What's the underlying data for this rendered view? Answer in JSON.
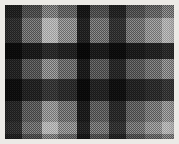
{
  "image": {
    "subject": "plaid-tartan-fabric-swatch",
    "description": "Grayscale checked plaid textile swatch with dithered halftone weave texture",
    "width": 179,
    "height": 144,
    "background_color": "#f2f2f0",
    "border_color": "#eceae6",
    "weave": {
      "x": 5,
      "y": 5,
      "width": 169,
      "height": 134,
      "texture": "halftone-dither-checkerboard",
      "texture_cell_px": 2
    },
    "palette": {
      "darkest": "#1c1c1c",
      "dark": "#343434",
      "mid_dark": "#4f4f4f",
      "mid": "#6e6e6e",
      "mid_light": "#8e8e8e",
      "light": "#b4b4b4",
      "lighter": "#d2d2d2",
      "lightest": "#ececec"
    },
    "warp_bands": [
      {
        "name": "warp-1-dark",
        "x": 0,
        "width": 17,
        "color": "#3a3a3a"
      },
      {
        "name": "warp-2-mid",
        "x": 17,
        "width": 20,
        "color": "#8a8a8a"
      },
      {
        "name": "warp-3-highlight",
        "x": 37,
        "width": 16,
        "color": "#e2e2e2"
      },
      {
        "name": "warp-4-light",
        "x": 53,
        "width": 19,
        "color": "#b0b0b0"
      },
      {
        "name": "warp-5-darkest",
        "x": 72,
        "width": 13,
        "color": "#2a2a2a"
      },
      {
        "name": "warp-6-mid",
        "x": 85,
        "width": 19,
        "color": "#8e8e8e"
      },
      {
        "name": "warp-7-dark",
        "x": 104,
        "width": 17,
        "color": "#3e3e3e"
      },
      {
        "name": "warp-8-mid-light",
        "x": 121,
        "width": 19,
        "color": "#909090"
      },
      {
        "name": "warp-9-light",
        "x": 140,
        "width": 17,
        "color": "#b6b6b6"
      },
      {
        "name": "warp-10-highlight",
        "x": 157,
        "width": 12,
        "color": "#e0e0e0"
      }
    ],
    "weft_bands": [
      {
        "name": "weft-1-mid",
        "y": 0,
        "height": 13,
        "color": "#8c8c8c"
      },
      {
        "name": "weft-2-light",
        "y": 13,
        "height": 25,
        "color": "#c8c8c8"
      },
      {
        "name": "weft-3-darkest",
        "y": 38,
        "height": 16,
        "color": "#2e2e2e"
      },
      {
        "name": "weft-4-mid",
        "y": 54,
        "height": 20,
        "color": "#9a9a9a"
      },
      {
        "name": "weft-5-dark",
        "y": 74,
        "height": 22,
        "color": "#3c3c3c"
      },
      {
        "name": "weft-6-mid-light",
        "y": 96,
        "height": 21,
        "color": "#a4a4a4"
      },
      {
        "name": "weft-7-light",
        "y": 117,
        "height": 12,
        "color": "#cacaca"
      },
      {
        "name": "weft-8-mid",
        "y": 129,
        "height": 5,
        "color": "#909090"
      }
    ]
  }
}
